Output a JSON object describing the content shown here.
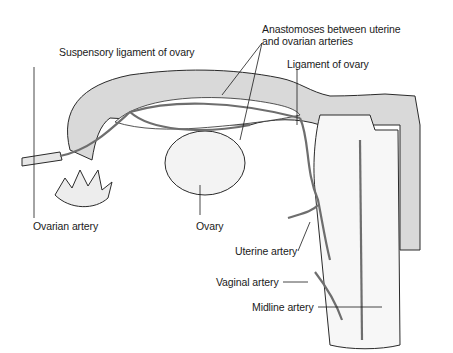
{
  "diagram": {
    "labels": {
      "anastomoses_line1": "Anastomoses between uterine",
      "anastomoses_line2": "and ovarian arteries",
      "suspensory_ligament": "Suspensory ligament of ovary",
      "ligament_of_ovary": "Ligament of ovary",
      "ovarian_artery": "Ovarian artery",
      "ovary": "Ovary",
      "uterine_artery": "Uterine artery",
      "vaginal_artery": "Vaginal artery",
      "midline_artery": "Midline artery"
    },
    "colors": {
      "tissue_fill": "#d9d9d9",
      "artery": "#6e6e6e",
      "outline": "#2a2a2a",
      "background": "#ffffff"
    }
  }
}
